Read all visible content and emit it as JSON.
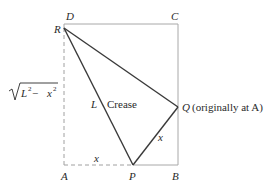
{
  "diagram": {
    "type": "paper-folding geometry",
    "colors": {
      "rectangle": "#a8a8a8",
      "crease": "#3a3a3a",
      "dashed": "#a0a0a0",
      "text": "#2a2a2a"
    },
    "points": {
      "A": {
        "label": "A",
        "x": 64,
        "y": 165
      },
      "B": {
        "label": "B",
        "x": 178,
        "y": 165
      },
      "C": {
        "label": "C",
        "x": 178,
        "y": 24
      },
      "D": {
        "label": "D",
        "x": 64,
        "y": 24
      },
      "R": {
        "label": "R",
        "x": 64,
        "y": 28
      },
      "P": {
        "label": "P",
        "x": 133,
        "y": 165
      },
      "Q": {
        "label": "Q",
        "x": 178,
        "y": 107
      }
    },
    "labels": {
      "A": "A",
      "B": "B",
      "C": "C",
      "D": "D",
      "R": "R",
      "P": "P",
      "Q": "Q",
      "q_note": "(originally at A)",
      "L": "L",
      "crease": "Crease",
      "x_bottom": "x",
      "x_slant": "x",
      "sqrt_expr_base": "L",
      "sqrt_expr_minus": " − ",
      "sqrt_expr_x": "x",
      "sqrt_exp": "2"
    }
  }
}
